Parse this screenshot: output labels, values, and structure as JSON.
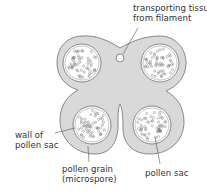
{
  "diagram": {
    "labels": {
      "transport_line1": "transporting tissue",
      "transport_line2": "from filament",
      "wall_line1": "wall of",
      "wall_line2": "pollen sac",
      "grain_line1": "pollen grain",
      "grain_line2": "(microspore)",
      "sac": "pollen sac"
    },
    "colors": {
      "tissue_fill": "#d9d9d9",
      "outline": "#6e6e6e",
      "sac_fill": "#ffffff"
    }
  }
}
